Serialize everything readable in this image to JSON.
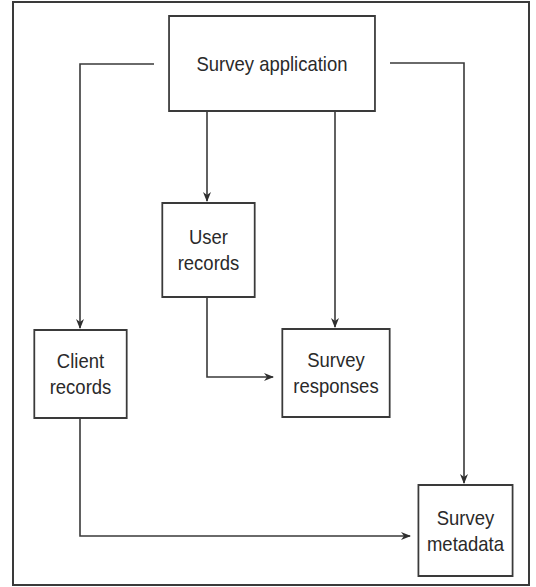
{
  "diagram": {
    "type": "flowchart",
    "nodes": [
      {
        "id": "app",
        "label": "Survey application"
      },
      {
        "id": "user",
        "label": "User\nrecords"
      },
      {
        "id": "client",
        "label": "Client\nrecords"
      },
      {
        "id": "responses",
        "label": "Survey\nresponses"
      },
      {
        "id": "metadata",
        "label": "Survey\nmetadata"
      }
    ],
    "edges": [
      {
        "from": "app",
        "to": "client"
      },
      {
        "from": "app",
        "to": "user"
      },
      {
        "from": "app",
        "to": "responses"
      },
      {
        "from": "app",
        "to": "metadata"
      },
      {
        "from": "user",
        "to": "responses"
      },
      {
        "from": "client",
        "to": "metadata"
      }
    ],
    "colors": {
      "line": "#3a3a3a",
      "text": "#2a2a2a",
      "background": "#ffffff"
    }
  }
}
